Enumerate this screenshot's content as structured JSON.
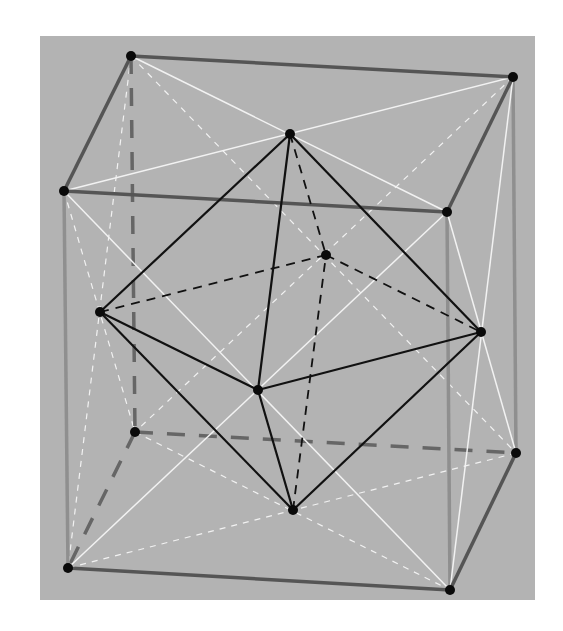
{
  "figure": {
    "colors": {
      "panel_background": "#b3b3b3",
      "cube_edge": "#555555",
      "cube_hidden_edge": "#666666",
      "cube_vertical_edge": "#8f8f8f",
      "face_diagonal": "#f2f2f2",
      "octahedron_edge": "#111111",
      "vertex": "#0a0a0a"
    },
    "cube_vertices": {
      "A": [
        131,
        56
      ],
      "B": [
        513,
        77
      ],
      "C": [
        64,
        191
      ],
      "D": [
        447,
        212
      ],
      "E": [
        135,
        432
      ],
      "F": [
        516,
        453
      ],
      "G": [
        68,
        568
      ],
      "H": [
        450,
        590
      ]
    },
    "octahedron_vertices": {
      "T": [
        290,
        134
      ],
      "Bo": [
        293,
        510
      ],
      "L": [
        100,
        312
      ],
      "R": [
        481,
        332
      ],
      "Fr": [
        258,
        390
      ],
      "Bk": [
        326,
        255
      ]
    },
    "cube_edges_visible": [
      [
        "A",
        "B"
      ],
      [
        "B",
        "D"
      ],
      [
        "D",
        "C"
      ],
      [
        "C",
        "A"
      ],
      [
        "G",
        "H"
      ],
      [
        "H",
        "F"
      ]
    ],
    "cube_edges_vertical": [
      [
        "C",
        "G"
      ],
      [
        "D",
        "H"
      ],
      [
        "B",
        "F"
      ]
    ],
    "cube_edges_hidden": [
      [
        "A",
        "E"
      ],
      [
        "E",
        "F"
      ],
      [
        "E",
        "G"
      ]
    ],
    "face_diagonals_visible": [
      [
        "A",
        "D"
      ],
      [
        "B",
        "C"
      ],
      [
        "C",
        "H"
      ],
      [
        "D",
        "G"
      ],
      [
        "D",
        "F"
      ],
      [
        "B",
        "H"
      ]
    ],
    "face_diagonals_hidden": [
      [
        "A",
        "F"
      ],
      [
        "B",
        "E"
      ],
      [
        "A",
        "G"
      ],
      [
        "C",
        "E"
      ],
      [
        "E",
        "H"
      ],
      [
        "F",
        "G"
      ]
    ],
    "octahedron_edges_visible": [
      [
        "T",
        "L"
      ],
      [
        "T",
        "R"
      ],
      [
        "T",
        "Fr"
      ],
      [
        "Bo",
        "L"
      ],
      [
        "Bo",
        "R"
      ],
      [
        "Bo",
        "Fr"
      ],
      [
        "L",
        "Fr"
      ],
      [
        "Fr",
        "R"
      ]
    ],
    "octahedron_edges_hidden": [
      [
        "T",
        "Bk"
      ],
      [
        "Bo",
        "Bk"
      ],
      [
        "L",
        "Bk"
      ],
      [
        "Bk",
        "R"
      ]
    ]
  }
}
